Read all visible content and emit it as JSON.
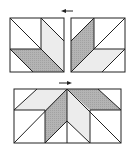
{
  "figure": {
    "colors": {
      "background": "#ffffff",
      "line": "#222222",
      "dark_fill": "#b4b4b4",
      "light_fill": "#ececec"
    },
    "arrows": [
      {
        "name": "top-arrow",
        "direction": "left",
        "x1": 73,
        "y1": 11,
        "x2": 62,
        "y2": 11
      },
      {
        "name": "bottom-arrow",
        "direction": "right",
        "x1": 59,
        "y1": 83,
        "x2": 71,
        "y2": 83
      }
    ],
    "blocks": [
      {
        "name": "top-left-block",
        "rect": [
          10,
          18,
          54,
          54
        ],
        "lines": [
          [
            10,
            18,
            64,
            72
          ],
          [
            41,
            18,
            41,
            49
          ],
          [
            10,
            49,
            41,
            49
          ],
          [
            41,
            18,
            64,
            41
          ],
          [
            10,
            49,
            33,
            72
          ]
        ],
        "dark": "10,49 41,49 64,72 33,72",
        "light": "41,18 64,41 64,72 41,49"
      },
      {
        "name": "top-right-block",
        "rect": [
          71,
          18,
          54,
          54
        ],
        "lines": [
          [
            125,
            18,
            71,
            72
          ],
          [
            94,
            18,
            94,
            49
          ],
          [
            94,
            49,
            125,
            49
          ],
          [
            94,
            18,
            71,
            41
          ],
          [
            125,
            49,
            102,
            72
          ]
        ],
        "dark": "71,41 94,18 94,49 71,72",
        "light": "94,49 125,49 102,72 71,72"
      },
      {
        "name": "bottom-joined-block",
        "rect": [
          14,
          89,
          107,
          54
        ],
        "lines": [
          [
            67,
            89,
            67,
            143
          ],
          [
            14,
            110,
            45,
            110
          ],
          [
            45,
            110,
            45,
            143
          ],
          [
            14,
            110,
            37,
            89
          ],
          [
            14,
            143,
            67,
            89
          ],
          [
            45,
            143,
            67,
            121
          ],
          [
            67,
            121,
            90,
            143
          ],
          [
            67,
            89,
            121,
            143
          ],
          [
            90,
            110,
            121,
            110
          ],
          [
            90,
            110,
            90,
            143
          ],
          [
            98,
            89,
            121,
            112
          ]
        ],
        "dark": [
          "45,110 67,89 67,121 45,143",
          "67,89 98,89 121,110 90,110"
        ],
        "light": [
          "14,110 37,89 67,89 45,110",
          "67,89 90,110 90,143 67,121"
        ]
      }
    ]
  }
}
